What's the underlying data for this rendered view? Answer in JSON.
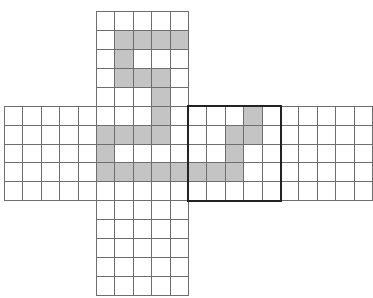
{
  "diagram": {
    "colors": {
      "grid_line": "#6e6e6e",
      "shaded": "#c4c4c4",
      "background": "#ffffff",
      "window_border": "#222222"
    },
    "geometry": {
      "origin_x": 4,
      "origin_y": 11,
      "cell_w": 18.4,
      "cell_h": 18.93
    },
    "vertical_strip": {
      "col_start": 5,
      "cols": 5,
      "row_start": 0,
      "rows": 15
    },
    "horizontal_strip": {
      "col_start": 0,
      "cols": 20,
      "row_start": 5,
      "rows": 5
    },
    "window": {
      "col_start": 10,
      "row_start": 5,
      "cols": 5,
      "rows": 5
    },
    "shaded_cells": [
      [
        6,
        1
      ],
      [
        7,
        1
      ],
      [
        8,
        1
      ],
      [
        9,
        1
      ],
      [
        6,
        2
      ],
      [
        6,
        3
      ],
      [
        7,
        3
      ],
      [
        8,
        3
      ],
      [
        8,
        4
      ],
      [
        8,
        5
      ],
      [
        13,
        5
      ],
      [
        5,
        6
      ],
      [
        6,
        6
      ],
      [
        7,
        6
      ],
      [
        8,
        6
      ],
      [
        12,
        6
      ],
      [
        13,
        6
      ],
      [
        5,
        7
      ],
      [
        12,
        7
      ],
      [
        5,
        8
      ],
      [
        6,
        8
      ],
      [
        7,
        8
      ],
      [
        8,
        8
      ],
      [
        9,
        8
      ],
      [
        10,
        8
      ],
      [
        11,
        8
      ],
      [
        12,
        8
      ]
    ]
  }
}
